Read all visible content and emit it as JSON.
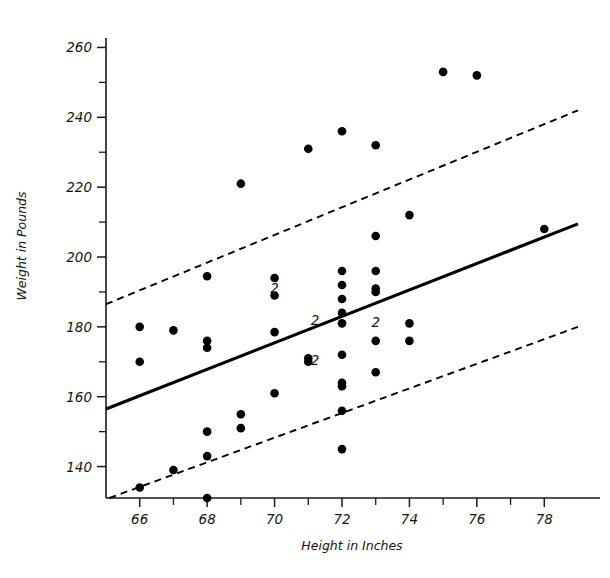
{
  "chart_data": {
    "type": "scatter",
    "title": "",
    "xlabel": "Height in Inches",
    "ylabel": "Weight in Pounds",
    "xlim": [
      65.0,
      79.0
    ],
    "ylim": [
      131.0,
      265.0
    ],
    "grid": false,
    "legend_position": "none",
    "x_ticks_major": [
      66,
      68,
      70,
      72,
      74,
      76,
      78
    ],
    "x_ticks_major_labels": [
      "66",
      "68",
      "70",
      "72",
      "74",
      "76",
      "78"
    ],
    "x_ticks_minor": [
      67,
      69,
      71,
      73,
      75,
      77
    ],
    "y_ticks_major": [
      140,
      160,
      180,
      200,
      220,
      240,
      260
    ],
    "y_ticks_major_labels": [
      "140",
      "160",
      "180",
      "200",
      "220",
      "240",
      "260"
    ],
    "y_ticks_minor": [
      150,
      170,
      190,
      210,
      230,
      250
    ],
    "points": [
      {
        "x": 66.0,
        "y": 180.0
      },
      {
        "x": 66.0,
        "y": 170.0
      },
      {
        "x": 66.0,
        "y": 134.0
      },
      {
        "x": 67.0,
        "y": 179.0
      },
      {
        "x": 67.0,
        "y": 139.0
      },
      {
        "x": 68.0,
        "y": 194.5
      },
      {
        "x": 68.0,
        "y": 176.0
      },
      {
        "x": 68.0,
        "y": 174.0
      },
      {
        "x": 68.0,
        "y": 150.0
      },
      {
        "x": 68.0,
        "y": 143.0
      },
      {
        "x": 68.0,
        "y": 131.0
      },
      {
        "x": 69.0,
        "y": 221.0
      },
      {
        "x": 69.0,
        "y": 155.0
      },
      {
        "x": 69.0,
        "y": 151.0
      },
      {
        "x": 70.0,
        "y": 194.0
      },
      {
        "x": 70.0,
        "y": 189.0
      },
      {
        "x": 70.0,
        "y": 178.5
      },
      {
        "x": 70.0,
        "y": 161.0
      },
      {
        "x": 71.0,
        "y": 231.0
      },
      {
        "x": 71.0,
        "y": 171.0
      },
      {
        "x": 71.0,
        "y": 170.0
      },
      {
        "x": 72.0,
        "y": 236.0
      },
      {
        "x": 72.0,
        "y": 196.0
      },
      {
        "x": 72.0,
        "y": 192.0
      },
      {
        "x": 72.0,
        "y": 188.0
      },
      {
        "x": 72.0,
        "y": 184.0
      },
      {
        "x": 72.0,
        "y": 181.0
      },
      {
        "x": 72.0,
        "y": 172.0
      },
      {
        "x": 72.0,
        "y": 164.0
      },
      {
        "x": 72.0,
        "y": 163.0
      },
      {
        "x": 72.0,
        "y": 156.0
      },
      {
        "x": 72.0,
        "y": 145.0
      },
      {
        "x": 73.0,
        "y": 232.0
      },
      {
        "x": 73.0,
        "y": 206.0
      },
      {
        "x": 73.0,
        "y": 196.0
      },
      {
        "x": 73.0,
        "y": 191.0
      },
      {
        "x": 73.0,
        "y": 190.0
      },
      {
        "x": 73.0,
        "y": 176.0
      },
      {
        "x": 73.0,
        "y": 167.0
      },
      {
        "x": 74.0,
        "y": 212.0
      },
      {
        "x": 74.0,
        "y": 181.0
      },
      {
        "x": 74.0,
        "y": 176.0
      },
      {
        "x": 75.0,
        "y": 253.0
      },
      {
        "x": 76.0,
        "y": 252.0
      },
      {
        "x": 78.0,
        "y": 208.0
      }
    ],
    "overlap_labels": [
      {
        "x": 70.0,
        "y": 191.0,
        "text": "2"
      },
      {
        "x": 71.2,
        "y": 182.0,
        "text": "2"
      },
      {
        "x": 71.2,
        "y": 170.5,
        "text": "2"
      },
      {
        "x": 73.0,
        "y": 181.5,
        "text": "2"
      }
    ],
    "lines": [
      {
        "name": "regression-fit",
        "style": "solid",
        "x": [
          65.0,
          79.0
        ],
        "y": [
          156.5,
          209.5
        ]
      },
      {
        "name": "upper-interval",
        "style": "dashed",
        "x": [
          65.0,
          79.0
        ],
        "y": [
          186.5,
          242.0
        ]
      },
      {
        "name": "lower-interval",
        "style": "dashed",
        "x": [
          65.1,
          79.0
        ],
        "y": [
          131.0,
          180.0
        ]
      }
    ]
  },
  "axes": {
    "x_title": "Height in Inches",
    "y_title": "Weight in Pounds"
  }
}
